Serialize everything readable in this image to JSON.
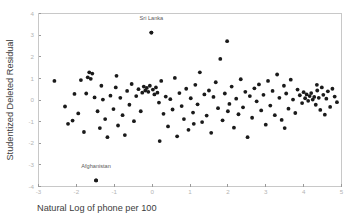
{
  "chart_data": {
    "type": "scatter",
    "title": "",
    "xlabel": "Natural Log of phone per 100",
    "ylabel": "Studentized Deleted Residual",
    "xlim": [
      -3,
      5
    ],
    "ylim": [
      -4,
      4
    ],
    "xticks": [
      -3,
      -2,
      -1,
      0,
      1,
      2,
      3,
      4,
      5
    ],
    "xtick_labels": [
      "-3",
      "-2",
      "-1",
      "0",
      "1",
      "2",
      "3",
      "4",
      "5"
    ],
    "yticks": [
      -4,
      -3,
      -2,
      -1,
      0,
      1,
      2,
      3,
      4
    ],
    "ytick_labels": [
      "-4",
      "-3",
      "-2",
      "-1",
      "0",
      "1",
      "2",
      "3",
      "4"
    ],
    "grid": false,
    "legend": false,
    "marker": "circle",
    "marker_color": "#1a1a1a",
    "marker_size": 1.9,
    "annotations": [
      {
        "text": "Sri Lanka",
        "x": -0.02,
        "y": 3.12,
        "label_dx": 0,
        "label_dy": 0.62
      },
      {
        "text": "Afghanistan",
        "x": -1.48,
        "y": -3.72,
        "label_dx": 0,
        "label_dy": 0.62
      }
    ],
    "points": [
      [
        -2.58,
        0.88
      ],
      [
        -2.3,
        -0.3
      ],
      [
        -2.22,
        -1.1
      ],
      [
        -2.05,
        0.28
      ],
      [
        -1.95,
        -0.62
      ],
      [
        -1.88,
        0.92
      ],
      [
        -1.8,
        -1.48
      ],
      [
        -1.74,
        0.3
      ],
      [
        -1.7,
        1.05
      ],
      [
        -1.66,
        1.28
      ],
      [
        -1.62,
        0.98
      ],
      [
        -1.58,
        1.22
      ],
      [
        -1.52,
        0.12
      ],
      [
        -1.48,
        -3.72
      ],
      [
        -1.44,
        -0.52
      ],
      [
        -1.38,
        -1.3
      ],
      [
        -1.3,
        0.02
      ],
      [
        -1.24,
        -0.88
      ],
      [
        -1.18,
        -1.72
      ],
      [
        -1.1,
        0.2
      ],
      [
        -1.02,
        -0.42
      ],
      [
        -0.96,
        0.58
      ],
      [
        -0.9,
        -1.18
      ],
      [
        -0.84,
        0.1
      ],
      [
        -0.78,
        -0.7
      ],
      [
        -0.72,
        -1.62
      ],
      [
        -0.66,
        0.42
      ],
      [
        -0.6,
        -0.22
      ],
      [
        -0.54,
        0.74
      ],
      [
        -0.48,
        -0.98
      ],
      [
        -0.42,
        0.18
      ],
      [
        -0.36,
        0.5
      ],
      [
        -0.3,
        -0.52
      ],
      [
        -0.26,
        0.34
      ],
      [
        -0.22,
        0.62
      ],
      [
        -0.18,
        0.44
      ],
      [
        -0.14,
        0.56
      ],
      [
        -0.1,
        0.38
      ],
      [
        -0.06,
        0.66
      ],
      [
        -0.02,
        3.12
      ],
      [
        0.02,
        0.48
      ],
      [
        0.06,
        0.26
      ],
      [
        0.1,
        0.58
      ],
      [
        0.14,
        0.34
      ],
      [
        0.18,
        -0.12
      ],
      [
        0.24,
        0.88
      ],
      [
        0.3,
        -0.64
      ],
      [
        0.36,
        0.16
      ],
      [
        0.42,
        -1.22
      ],
      [
        0.48,
        0.04
      ],
      [
        0.54,
        -0.44
      ],
      [
        0.6,
        1.02
      ],
      [
        0.66,
        -1.68
      ],
      [
        0.72,
        0.32
      ],
      [
        0.78,
        -0.28
      ],
      [
        0.84,
        -0.88
      ],
      [
        0.9,
        0.52
      ],
      [
        0.96,
        -1.38
      ],
      [
        1.02,
        0.08
      ],
      [
        1.08,
        -0.58
      ],
      [
        1.14,
        0.7
      ],
      [
        1.2,
        -0.2
      ],
      [
        1.26,
        1.28
      ],
      [
        1.32,
        -1.02
      ],
      [
        1.38,
        0.26
      ],
      [
        1.44,
        -0.72
      ],
      [
        1.5,
        0.44
      ],
      [
        1.56,
        -1.52
      ],
      [
        1.62,
        0.14
      ],
      [
        1.68,
        0.82
      ],
      [
        1.74,
        -0.38
      ],
      [
        1.8,
        1.9
      ],
      [
        1.86,
        -0.94
      ],
      [
        1.92,
        0.3
      ],
      [
        1.98,
        2.72
      ],
      [
        2.04,
        -0.18
      ],
      [
        2.1,
        0.62
      ],
      [
        2.16,
        -1.28
      ],
      [
        2.22,
        0.06
      ],
      [
        2.28,
        -0.66
      ],
      [
        2.34,
        0.96
      ],
      [
        2.4,
        -0.34
      ],
      [
        2.46,
        0.38
      ],
      [
        2.52,
        -1.72
      ],
      [
        2.58,
        0.18
      ],
      [
        2.64,
        -0.82
      ],
      [
        2.7,
        0.54
      ],
      [
        2.76,
        -0.06
      ],
      [
        2.82,
        0.72
      ],
      [
        2.88,
        -0.48
      ],
      [
        2.94,
        0.24
      ],
      [
        3.0,
        -1.14
      ],
      [
        3.06,
        0.88
      ],
      [
        3.12,
        -0.26
      ],
      [
        3.18,
        0.42
      ],
      [
        3.24,
        -0.7
      ],
      [
        3.3,
        1.18
      ],
      [
        3.36,
        0.1
      ],
      [
        3.42,
        -0.92
      ],
      [
        3.48,
        0.66
      ],
      [
        3.54,
        0.3
      ],
      [
        3.6,
        -0.4
      ],
      [
        3.66,
        0.94
      ],
      [
        3.72,
        0.02
      ],
      [
        3.78,
        -0.6
      ],
      [
        3.84,
        0.48
      ],
      [
        3.9,
        0.22
      ],
      [
        3.96,
        -0.14
      ],
      [
        4.0,
        0.36
      ],
      [
        4.04,
        0.08
      ],
      [
        4.08,
        0.26
      ],
      [
        4.12,
        -0.04
      ],
      [
        4.16,
        0.18
      ],
      [
        4.2,
        0.32
      ],
      [
        4.24,
        0.02
      ],
      [
        4.28,
        0.14
      ],
      [
        4.32,
        -0.22
      ],
      [
        4.36,
        0.44
      ],
      [
        4.4,
        0.1
      ],
      [
        4.44,
        -0.46
      ],
      [
        4.48,
        0.58
      ],
      [
        4.52,
        0.24
      ],
      [
        4.56,
        -0.68
      ],
      [
        4.6,
        0.06
      ],
      [
        4.64,
        0.4
      ],
      [
        4.7,
        -0.32
      ],
      [
        4.76,
        0.52
      ],
      [
        4.82,
        0.16
      ],
      [
        4.88,
        -0.1
      ],
      [
        -2.1,
        -0.95
      ],
      [
        -1.34,
        0.66
      ],
      [
        -0.94,
        1.12
      ],
      [
        0.2,
        -1.9
      ],
      [
        1.1,
        -1.1
      ],
      [
        2.0,
        -0.52
      ],
      [
        3.5,
        -1.3
      ],
      [
        4.35,
        0.7
      ]
    ]
  }
}
